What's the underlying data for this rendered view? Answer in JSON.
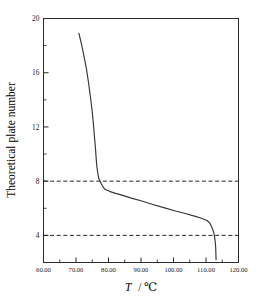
{
  "chart_data": {
    "type": "line",
    "title": "",
    "xlabel": "T / ℃",
    "xlabel_symbol": "T",
    "xlabel_unit": "/ ℃",
    "ylabel": "Theoretical plate number",
    "xlim": [
      60.0,
      120.0
    ],
    "ylim": [
      2.0,
      20.0
    ],
    "grid": false,
    "legend": null,
    "x_ticks": [
      60.0,
      70.0,
      80.0,
      90.0,
      100.0,
      110.0,
      120.0
    ],
    "x_tick_labels": [
      "60.00",
      "70.00",
      "80.00",
      "90.00",
      "100.00",
      "110.00",
      "120.00"
    ],
    "x_minor_ticks": [
      65.0,
      75.0,
      85.0,
      95.0,
      105.0,
      115.0
    ],
    "y_ticks": [
      4,
      8,
      12,
      16,
      20
    ],
    "y_tick_labels": [
      "4",
      "8",
      "12",
      "16",
      "20"
    ],
    "y_minor_ticks": [
      6,
      10,
      14,
      18
    ],
    "annotations": [
      {
        "name": "reference-line-plate-8",
        "type": "hline",
        "y": 8,
        "style": "dashed"
      },
      {
        "name": "reference-line-plate-4",
        "type": "hline",
        "y": 4,
        "style": "dashed"
      }
    ],
    "series": [
      {
        "name": "temperature-profile",
        "style": "solid",
        "color": "#353535",
        "x": [
          70.9,
          71.6,
          72.4,
          73.2,
          73.9,
          74.5,
          75.0,
          75.4,
          75.7,
          76.0,
          76.2,
          76.4,
          76.7,
          77.0,
          77.4,
          78.0,
          78.9,
          80.3,
          82.2,
          84.4,
          87.0,
          90.0,
          93.4,
          97.0,
          100.6,
          103.9,
          106.7,
          108.8,
          110.3,
          111.2,
          111.9,
          112.4,
          112.7,
          112.9,
          113.0,
          113.05,
          113.1
        ],
        "y": [
          18.9,
          18.2,
          17.3,
          16.3,
          15.2,
          14.1,
          13.1,
          12.1,
          11.2,
          10.4,
          9.7,
          9.1,
          8.6,
          8.2,
          8.0,
          7.7,
          7.4,
          7.25,
          7.1,
          6.95,
          6.75,
          6.55,
          6.3,
          6.05,
          5.8,
          5.6,
          5.4,
          5.25,
          5.1,
          4.9,
          4.55,
          4.2,
          3.8,
          3.4,
          3.0,
          2.6,
          2.2
        ]
      }
    ]
  },
  "axes": {
    "y_axis_title": "Theoretical plate number",
    "x_axis_title_symbol": "T",
    "x_axis_title_rest": "/ ℃"
  }
}
